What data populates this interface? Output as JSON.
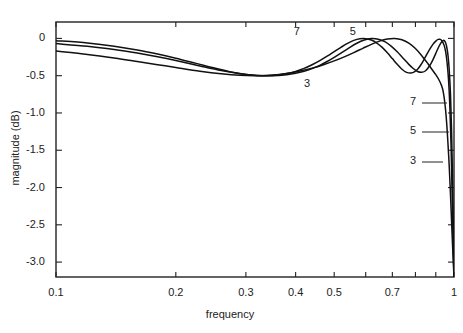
{
  "chart_data": {
    "type": "line",
    "title": "",
    "xlabel": "frequency",
    "ylabel": "magnitude  (dB)",
    "xscale": "log",
    "xlim": [
      0.1,
      1.0
    ],
    "ylim": [
      -3.2,
      0.22
    ],
    "grid": false,
    "legend_position": "inline-annotations",
    "xticks": [
      0.1,
      0.2,
      0.3,
      0.4,
      0.5,
      0.6,
      0.7,
      0.8,
      0.9,
      1.0
    ],
    "xtick_labels": [
      "0.1",
      "0.2",
      "0.3",
      "0.4",
      "0.5",
      "",
      "0.7",
      "",
      "",
      "1"
    ],
    "yticks": [
      0,
      -0.5,
      -1.0,
      -1.5,
      -2.0,
      -2.5,
      -3.0
    ],
    "ytick_labels": [
      "0",
      "-0.5",
      "-1.0",
      "-1.5",
      "-2.0",
      "-2.5",
      "-3.0"
    ],
    "passband_ripple_db": 0.5,
    "series": [
      {
        "name": "3",
        "label": "3",
        "order": 3,
        "color": "#111111",
        "x": [
          0.1,
          0.12,
          0.14,
          0.16,
          0.18,
          0.2,
          0.23,
          0.26,
          0.29,
          0.32,
          0.35,
          0.38,
          0.41,
          0.44,
          0.47,
          0.5,
          0.53,
          0.56,
          0.59,
          0.62,
          0.65,
          0.68,
          0.71,
          0.74,
          0.77,
          0.8,
          0.83,
          0.86,
          0.88,
          0.9,
          0.915,
          0.93,
          0.94,
          0.95,
          0.958,
          0.965,
          0.972,
          0.978,
          0.984,
          0.99,
          0.995,
          1.0
        ],
        "y": [
          -0.17,
          -0.215,
          -0.262,
          -0.309,
          -0.352,
          -0.39,
          -0.439,
          -0.474,
          -0.495,
          -0.5,
          -0.491,
          -0.47,
          -0.438,
          -0.399,
          -0.353,
          -0.302,
          -0.247,
          -0.19,
          -0.133,
          -0.08,
          -0.037,
          -0.009,
          -0.001,
          -0.018,
          -0.063,
          -0.136,
          -0.232,
          -0.339,
          -0.414,
          -0.486,
          -0.548,
          -0.63,
          -0.72,
          -0.9,
          -1.12,
          -1.38,
          -1.68,
          -1.99,
          -2.33,
          -2.68,
          -2.95,
          -3.2
        ]
      },
      {
        "name": "5",
        "label": "5",
        "order": 5,
        "color": "#111111",
        "x": [
          0.1,
          0.12,
          0.14,
          0.16,
          0.18,
          0.2,
          0.23,
          0.26,
          0.29,
          0.32,
          0.35,
          0.38,
          0.4,
          0.42,
          0.44,
          0.46,
          0.48,
          0.5,
          0.52,
          0.545,
          0.57,
          0.595,
          0.62,
          0.645,
          0.67,
          0.695,
          0.72,
          0.745,
          0.77,
          0.79,
          0.81,
          0.83,
          0.85,
          0.87,
          0.885,
          0.9,
          0.915,
          0.928,
          0.94,
          0.95,
          0.958,
          0.966,
          0.973,
          0.98,
          0.986,
          0.991,
          0.996,
          1.0
        ],
        "y": [
          -0.07,
          -0.105,
          -0.148,
          -0.196,
          -0.246,
          -0.296,
          -0.369,
          -0.43,
          -0.473,
          -0.496,
          -0.5,
          -0.486,
          -0.468,
          -0.441,
          -0.405,
          -0.361,
          -0.31,
          -0.254,
          -0.196,
          -0.126,
          -0.065,
          -0.022,
          -0.002,
          -0.01,
          -0.044,
          -0.103,
          -0.18,
          -0.266,
          -0.348,
          -0.404,
          -0.444,
          -0.455,
          -0.43,
          -0.36,
          -0.287,
          -0.2,
          -0.115,
          -0.056,
          -0.027,
          -0.042,
          -0.105,
          -0.23,
          -0.43,
          -0.76,
          -1.23,
          -1.82,
          -2.52,
          -3.2
        ]
      },
      {
        "name": "7",
        "label": "7",
        "order": 7,
        "color": "#111111",
        "x": [
          0.1,
          0.12,
          0.14,
          0.16,
          0.18,
          0.2,
          0.225,
          0.25,
          0.275,
          0.3,
          0.32,
          0.34,
          0.36,
          0.38,
          0.4,
          0.42,
          0.44,
          0.46,
          0.48,
          0.5,
          0.52,
          0.54,
          0.56,
          0.58,
          0.6,
          0.62,
          0.64,
          0.66,
          0.68,
          0.7,
          0.72,
          0.74,
          0.76,
          0.78,
          0.795,
          0.81,
          0.825,
          0.84,
          0.855,
          0.87,
          0.885,
          0.9,
          0.912,
          0.924,
          0.934,
          0.944,
          0.953,
          0.961,
          0.969,
          0.976,
          0.983,
          0.989,
          0.994,
          1.0
        ],
        "y": [
          -0.03,
          -0.062,
          -0.104,
          -0.154,
          -0.209,
          -0.265,
          -0.335,
          -0.398,
          -0.449,
          -0.483,
          -0.497,
          -0.5,
          -0.492,
          -0.472,
          -0.442,
          -0.402,
          -0.353,
          -0.298,
          -0.238,
          -0.177,
          -0.119,
          -0.067,
          -0.027,
          -0.005,
          -0.003,
          -0.022,
          -0.062,
          -0.12,
          -0.192,
          -0.271,
          -0.348,
          -0.414,
          -0.456,
          -0.465,
          -0.45,
          -0.414,
          -0.357,
          -0.287,
          -0.211,
          -0.14,
          -0.08,
          -0.036,
          -0.013,
          -0.013,
          -0.038,
          -0.09,
          -0.18,
          -0.33,
          -0.56,
          -0.9,
          -1.43,
          -2.07,
          -2.64,
          -3.2
        ]
      }
    ],
    "inline_labels": [
      {
        "text": "7",
        "x": 0.405,
        "y": 0.07
      },
      {
        "text": "5",
        "x": 0.56,
        "y": 0.07
      },
      {
        "text": "3",
        "x": 0.43,
        "y": -0.62
      }
    ],
    "callout_labels": [
      {
        "text": "7",
        "label_x_px": 412,
        "label_y_px": 103,
        "leader_to_x_px": 447,
        "leader_to_y_px": 103
      },
      {
        "text": "5",
        "label_x_px": 412,
        "label_y_px": 132,
        "leader_to_x_px": 449,
        "leader_to_y_px": 132
      },
      {
        "text": "3",
        "label_x_px": 412,
        "label_y_px": 162,
        "leader_to_x_px": 443,
        "leader_to_y_px": 162
      }
    ]
  },
  "axes": {
    "x_title": "frequency",
    "y_title": "magnitude  (dB)"
  },
  "colors": {
    "axis": "#222222",
    "curve": "#111111",
    "background": "#ffffff",
    "text": "#222222"
  }
}
